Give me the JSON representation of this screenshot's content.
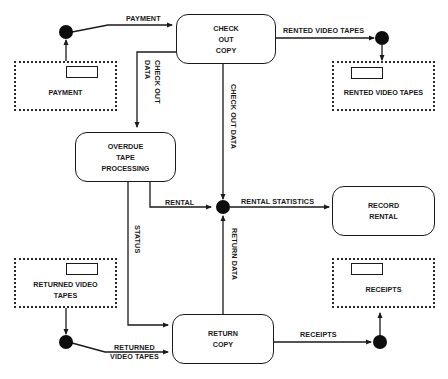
{
  "processes": {
    "check_out_copy": "CHECK\nOUT\nCOPY",
    "overdue_tape_processing": "OVERDUE\nTAPE\nPROCESSING",
    "record_rental": "RECORD\nRENTAL",
    "return_copy": "RETURN\nCOPY"
  },
  "stores": {
    "payment": "PAYMENT",
    "rented_video_tapes": "RENTED VIDEO TAPES",
    "returned_video_tapes": "RETURNED VIDEO\nTAPES",
    "receipts": "RECEIPTS"
  },
  "flows": {
    "payment": "PAYMENT",
    "rented_video_tapes": "RENTED VIDEO TAPES",
    "check_out_data_left": "CHECK OUT\nDATA",
    "check_out_data_right": "CHECK OUT DATA",
    "rental": "RENTAL",
    "rental_statistics": "RENTAL STATISTICS",
    "status": "STATUS",
    "return_data": "RETURN DATA",
    "returned_video_tapes": "RETURNED\nVIDEO TAPES",
    "receipts": "RECEIPTS"
  },
  "colors": {
    "line": "#1a1a1a",
    "background": "#ffffff",
    "node": "#0d0d0d"
  }
}
